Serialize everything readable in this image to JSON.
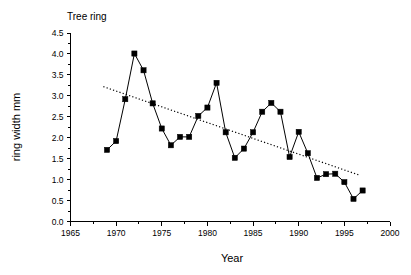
{
  "chart_data": {
    "type": "line",
    "title": "Tree ring",
    "xlabel": "Year",
    "ylabel": "ring width mm",
    "xlim": [
      1965,
      2000
    ],
    "ylim": [
      0.0,
      4.5
    ],
    "grid": false,
    "legend": "none",
    "x_major_ticks": [
      1965,
      1970,
      1975,
      1980,
      1985,
      1990,
      1995,
      2000
    ],
    "x_tick_labels": [
      "1965",
      "1970",
      "1975",
      "1980",
      "1985",
      "1990",
      "1995",
      "2000"
    ],
    "x_minor_tick_interval": 1,
    "y_major_ticks": [
      0.0,
      0.5,
      1.0,
      1.5,
      2.0,
      2.5,
      3.0,
      3.5,
      4.0,
      4.5
    ],
    "y_tick_labels": [
      "0.0",
      "0.5",
      "1.0",
      "1.5",
      "2.0",
      "2.5",
      "3.0",
      "3.5",
      "4.0",
      "4.5"
    ],
    "x": [
      1969,
      1970,
      1971,
      1972,
      1973,
      1974,
      1975,
      1976,
      1977,
      1978,
      1979,
      1980,
      1981,
      1982,
      1983,
      1984,
      1985,
      1986,
      1987,
      1988,
      1989,
      1990,
      1991,
      1992,
      1993,
      1994,
      1995,
      1996,
      1997
    ],
    "series": [
      {
        "name": "ring width",
        "marker": "filled-square",
        "line_style": "solid",
        "color": "#000000",
        "values": [
          1.71,
          1.92,
          2.92,
          4.01,
          3.61,
          2.82,
          2.22,
          1.82,
          2.02,
          2.02,
          2.52,
          2.72,
          3.31,
          2.13,
          1.52,
          1.74,
          2.13,
          2.62,
          2.83,
          2.62,
          1.54,
          2.14,
          1.63,
          1.04,
          1.13,
          1.14,
          0.94,
          0.54,
          0.74
        ]
      },
      {
        "name": "linear trend",
        "marker": "none",
        "line_style": "dotted",
        "color": "#000000",
        "x_endpoints": [
          1968.6,
          1996.6
        ],
        "y_endpoints": [
          3.22,
          1.11
        ]
      }
    ]
  },
  "figure": {
    "background_color": "#ffffff",
    "foreground_color": "#000000"
  }
}
